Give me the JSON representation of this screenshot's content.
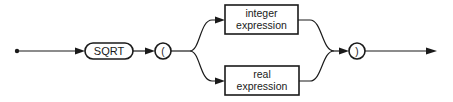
{
  "diagram": {
    "type": "syntax-railroad",
    "colors": {
      "stroke": "#1a1a1a",
      "background": "#ffffff"
    },
    "nodes": {
      "start": {
        "kind": "entry-dot"
      },
      "sqrt": {
        "kind": "terminal",
        "label": "SQRT"
      },
      "open_paren": {
        "kind": "terminal-circle",
        "label": "("
      },
      "integer_expression": {
        "kind": "nonterminal",
        "line1": "integer",
        "line2": "expression"
      },
      "real_expression": {
        "kind": "nonterminal",
        "line1": "real",
        "line2": "expression"
      },
      "close_paren": {
        "kind": "terminal-circle",
        "label": ")"
      },
      "end": {
        "kind": "exit-arrow"
      }
    },
    "edges": [
      [
        "start",
        "sqrt"
      ],
      [
        "sqrt",
        "open_paren"
      ],
      [
        "open_paren",
        "integer_expression"
      ],
      [
        "open_paren",
        "real_expression"
      ],
      [
        "integer_expression",
        "close_paren"
      ],
      [
        "real_expression",
        "close_paren"
      ],
      [
        "close_paren",
        "end"
      ]
    ]
  }
}
